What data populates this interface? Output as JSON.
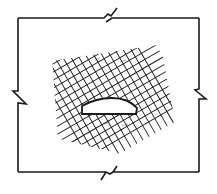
{
  "diagram": {
    "title": "Finite region with rotated mesh around elliptical opening",
    "stroke_color": "#1a1a1a",
    "background": "#ffffff",
    "boundary": {
      "shape": "rectangle-with-break-marks",
      "x": 18,
      "y": 18,
      "width": 181,
      "height": 154,
      "break_marks": [
        "top",
        "right",
        "bottom",
        "left"
      ]
    },
    "mesh": {
      "type": "rotated-grid",
      "center": [
        106,
        90
      ],
      "rotation_deg": -30,
      "line_count_each_direction": 14,
      "spacing": 7
    },
    "opening": {
      "shape": "half-ellipse",
      "center": [
        109,
        108
      ],
      "width": 55,
      "height": 16
    }
  }
}
